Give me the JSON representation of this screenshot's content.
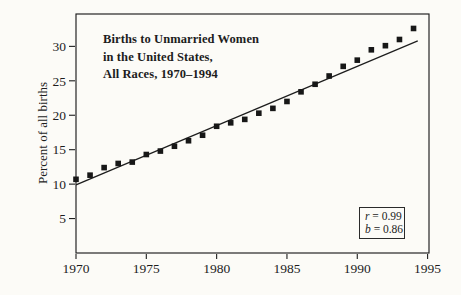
{
  "figure": {
    "title_lines": [
      "Births to Unmarried Women",
      "in the United States,",
      "All Races, 1970–1994"
    ],
    "y_axis_label": "Percent of all births",
    "stats_box": {
      "lines": [
        {
          "var": "r",
          "rest": " = 0.99"
        },
        {
          "var": "b",
          "rest": " = 0.86"
        }
      ]
    },
    "colors": {
      "ink": "#1d1d1d",
      "paper": "#fcfbf7",
      "marker": "#171717"
    }
  },
  "chart_data": {
    "type": "scatter",
    "title": "Births to Unmarried Women in the United States, All Races, 1970–1994",
    "xlabel": "",
    "ylabel": "Percent of all births",
    "x": [
      1970,
      1971,
      1972,
      1973,
      1974,
      1975,
      1976,
      1977,
      1978,
      1979,
      1980,
      1981,
      1982,
      1983,
      1984,
      1985,
      1986,
      1987,
      1988,
      1989,
      1990,
      1991,
      1992,
      1993,
      1994
    ],
    "y": [
      10.7,
      11.3,
      12.4,
      13.0,
      13.2,
      14.3,
      14.8,
      15.5,
      16.3,
      17.1,
      18.4,
      18.9,
      19.4,
      20.3,
      21.0,
      22.0,
      23.4,
      24.5,
      25.7,
      27.1,
      28.0,
      29.5,
      30.1,
      31.0,
      32.6
    ],
    "x_ticks": [
      1970,
      1975,
      1980,
      1985,
      1990,
      1995
    ],
    "y_ticks": [
      5,
      10,
      15,
      20,
      25,
      30
    ],
    "xlim": [
      1970,
      1995.1
    ],
    "ylim": [
      0,
      34.7
    ],
    "grid": false,
    "legend": false,
    "marker": "filled-square",
    "trend_line": {
      "x1": 1970,
      "y1": 9.9,
      "x2": 1994.3,
      "y2": 30.8,
      "r": 0.99,
      "b": 0.86
    },
    "annotations": [
      "r = 0.99",
      "b = 0.86"
    ]
  }
}
